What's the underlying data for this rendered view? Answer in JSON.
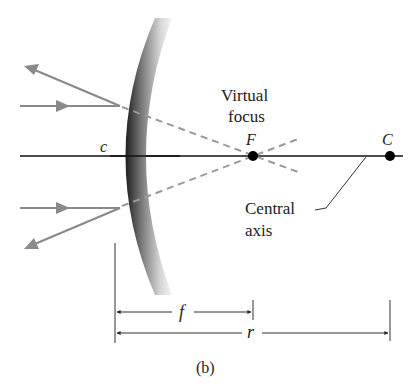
{
  "figure": {
    "panel_label": "(b)",
    "labels": {
      "vertex": "c",
      "focus_point": "F",
      "center_point": "C",
      "virtual_focus_line1": "Virtual",
      "virtual_focus_line2": "focus",
      "central_axis_line1": "Central",
      "central_axis_line2": "axis",
      "focal_length": "f",
      "radius": "r"
    },
    "colors": {
      "ray": "#8a8a8a",
      "axis": "#111111",
      "mirror_dark": "#2a2a2a",
      "mirror_light": "#f2f2f2",
      "point": "#000000",
      "text": "#222222"
    },
    "elements": {
      "mirror_type": "convex mirror",
      "rays": [
        "upper incident ray",
        "upper reflected ray",
        "lower incident ray",
        "lower reflected ray"
      ],
      "dashed_extensions": [
        "upper virtual ray to F",
        "lower virtual ray to F"
      ]
    }
  }
}
